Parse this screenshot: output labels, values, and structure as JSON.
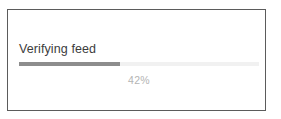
{
  "card": {
    "border_color": "#5b5b5b",
    "background": "#ffffff"
  },
  "status": {
    "label": "Verifying feed",
    "label_color": "#3c3c3c"
  },
  "progress": {
    "percent_value": 42,
    "percent_label": "42%",
    "percent_text_color": "#b4b4b4",
    "fill_color": "#8d8d8d",
    "track_color": "#f1f1f1"
  }
}
